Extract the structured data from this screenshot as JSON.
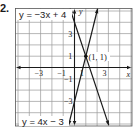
{
  "problem": {
    "number": "2."
  },
  "chart_data": {
    "type": "line",
    "title": "",
    "xlabel": "x",
    "ylabel": "y",
    "xlim": [
      -5.2,
      5.1
    ],
    "ylim": [
      -5.1,
      5.2
    ],
    "grid": true,
    "grid_step": 1,
    "x_tick_labels": [
      "-3",
      "-1",
      "1",
      "3"
    ],
    "x_tick_values": [
      -3,
      -1,
      1,
      3
    ],
    "y_tick_labels": [
      "3",
      "1",
      "-1",
      "-3"
    ],
    "y_tick_values": [
      3,
      1,
      -1,
      -3
    ],
    "series": [
      {
        "name": "y = -3x + 4",
        "slope": -3,
        "intercept": 4,
        "x": [
          -0.4,
          3.03
        ],
        "y": [
          5.2,
          -5.1
        ]
      },
      {
        "name": "y = 4x - 3",
        "slope": 4,
        "intercept": -3,
        "x": [
          -0.52,
          2.05
        ],
        "y": [
          -5.1,
          5.2
        ]
      }
    ],
    "annotations": [
      {
        "text": "(1, 1)",
        "x": 1,
        "y": 1,
        "type": "intersection-point"
      }
    ],
    "labels": {
      "line1": "y = −3x + 4",
      "line2": "y = 4x − 3",
      "point": "(1, 1)",
      "x_axis": "x",
      "y_axis": "y"
    },
    "colors": {
      "grid": "#9a9a9a",
      "axes": "#1a1a1a",
      "lines": "#1a1a1a",
      "background": "#ffffff"
    }
  }
}
